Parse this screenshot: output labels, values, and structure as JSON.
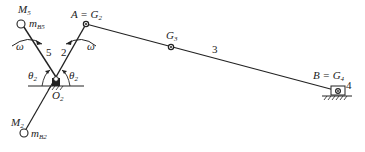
{
  "diagram": {
    "type": "mechanism-kinematic-diagram",
    "labels": {
      "M5": {
        "main": "M",
        "sub": "5"
      },
      "mB5": {
        "main": "m",
        "sub": "B5"
      },
      "A_eq_G2": {
        "main": "A = G",
        "sub": "2"
      },
      "G3": {
        "main": "G",
        "sub": "3"
      },
      "link3": "3",
      "link5": "5",
      "link2": "2",
      "link4": "4",
      "omega_left": "ω",
      "omega_right": "ω",
      "theta_left": {
        "main": "θ",
        "sub": "2"
      },
      "theta_right": {
        "main": "θ",
        "sub": "2"
      },
      "O2": {
        "main": "O",
        "sub": "2"
      },
      "B_eq_G4": {
        "main": "B = G",
        "sub": "4"
      },
      "M2": {
        "main": "M",
        "sub": "2"
      },
      "mB2": {
        "main": "m",
        "sub": "B2"
      }
    },
    "colors": {
      "stroke": "#222222",
      "background": "#ffffff"
    }
  }
}
